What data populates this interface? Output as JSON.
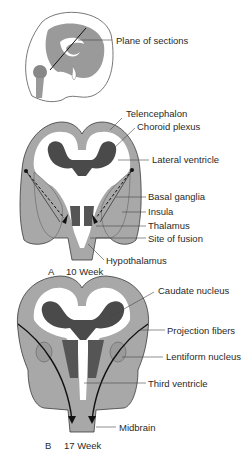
{
  "figure": {
    "panels": [
      {
        "id": "overview",
        "description": "sagittal fetal head showing plane of coronal sections",
        "labels": [
          {
            "text": "Plane of sections"
          }
        ]
      },
      {
        "id": "A",
        "letter": "A",
        "age": "10 Week",
        "labels": [
          {
            "text": "Telencephalon"
          },
          {
            "text": "Choroid plexus"
          },
          {
            "text": "Lateral ventricle"
          },
          {
            "text": "Basal ganglia"
          },
          {
            "text": "Insula"
          },
          {
            "text": "Thalamus"
          },
          {
            "text": "Site of fusion"
          },
          {
            "text": "Hypothalamus"
          }
        ]
      },
      {
        "id": "B",
        "letter": "B",
        "age": "17 Week",
        "labels": [
          {
            "text": "Caudate nucleus"
          },
          {
            "text": "Projection fibers"
          },
          {
            "text": "Lentiform nucleus"
          },
          {
            "text": "Third ventricle"
          },
          {
            "text": "Midbrain"
          }
        ]
      }
    ],
    "colors": {
      "tissue": "#a8a8a8",
      "outline": "#3a3a3a",
      "dark_nuclei": "#555555",
      "choroid": "#4a4a4a",
      "ventricle": "#ffffff"
    }
  }
}
